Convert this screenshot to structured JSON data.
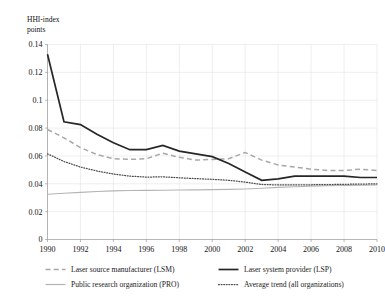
{
  "chart_data": {
    "type": "line",
    "title": "",
    "xlabel": "",
    "ylabel": "HHI-index\npoints",
    "x": [
      1990,
      1991,
      1992,
      1993,
      1994,
      1995,
      1996,
      1997,
      1998,
      1999,
      2000,
      2001,
      2002,
      2003,
      2004,
      2005,
      2006,
      2007,
      2008,
      2009,
      2010
    ],
    "xlim": [
      1990,
      2010
    ],
    "ylim": [
      0,
      0.14
    ],
    "xticks": [
      "1990",
      "1992",
      "1994",
      "1996",
      "1998",
      "2000",
      "2002",
      "2004",
      "2006",
      "2008",
      "2010"
    ],
    "yticks": [
      "0",
      "0.02",
      "0.04",
      "0.06",
      "0.08",
      "0.1",
      "0.12",
      "0.14"
    ],
    "grid": true,
    "legend_position": "bottom",
    "series": [
      {
        "name": "Laser source manufacturer (LSM)",
        "key": "lsm",
        "style": "dashed",
        "color": "#a8a8a8",
        "values": [
          0.079,
          0.073,
          0.066,
          0.061,
          0.058,
          0.0575,
          0.058,
          0.062,
          0.059,
          0.057,
          0.0575,
          0.058,
          0.0625,
          0.057,
          0.0535,
          0.052,
          0.0505,
          0.0495,
          0.0495,
          0.0505,
          0.0495
        ]
      },
      {
        "name": "Laser system provider (LSP)",
        "key": "lsp",
        "style": "solid-thick",
        "color": "#262626",
        "values": [
          0.133,
          0.0845,
          0.0825,
          0.0755,
          0.0695,
          0.0645,
          0.0645,
          0.0675,
          0.0635,
          0.0615,
          0.0595,
          0.0545,
          0.0485,
          0.0425,
          0.0435,
          0.0455,
          0.0455,
          0.0455,
          0.0455,
          0.0445,
          0.0445
        ]
      },
      {
        "name": "Public research organization (PRO)",
        "key": "pro",
        "style": "solid-thin",
        "color": "#b4b4b4",
        "values": [
          0.0325,
          0.0332,
          0.0338,
          0.0345,
          0.0349,
          0.0352,
          0.0353,
          0.0354,
          0.0355,
          0.0356,
          0.0358,
          0.036,
          0.0363,
          0.0368,
          0.0374,
          0.0379,
          0.0383,
          0.0386,
          0.0388,
          0.039,
          0.0391
        ]
      },
      {
        "name": "Average trend (all organizations)",
        "key": "avg",
        "style": "dotted",
        "color": "#4d4d4d",
        "values": [
          0.0615,
          0.056,
          0.052,
          0.0492,
          0.047,
          0.0455,
          0.0448,
          0.045,
          0.0443,
          0.0437,
          0.0432,
          0.0425,
          0.0412,
          0.0395,
          0.0392,
          0.0392,
          0.0393,
          0.0394,
          0.0396,
          0.0398,
          0.0399
        ]
      }
    ]
  },
  "legend": {
    "items": [
      {
        "label": "Laser source manufacturer (LSM)",
        "key": "lsm"
      },
      {
        "label": "Laser system provider (LSP)",
        "key": "lsp"
      },
      {
        "label": "Public research organization (PRO)",
        "key": "pro"
      },
      {
        "label": "Average trend (all organizations)",
        "key": "avg"
      }
    ]
  }
}
